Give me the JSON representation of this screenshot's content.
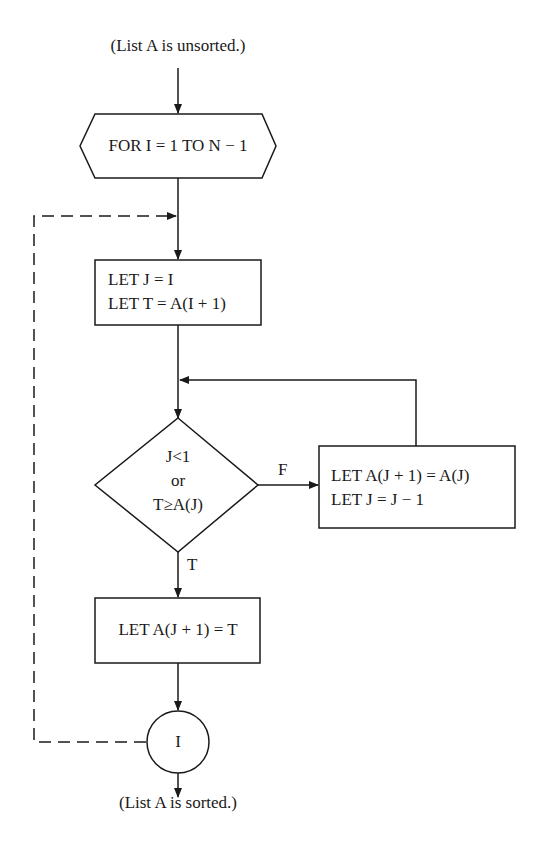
{
  "diagram": {
    "type": "flowchart",
    "start_label": "(List A is unsorted.)",
    "end_label": "(List A is sorted.)",
    "loop_header": "FOR I = 1 TO N − 1",
    "init_block": {
      "line1": "LET J = I",
      "line2": "LET T = A(I + 1)"
    },
    "decision": {
      "line1": "J<1",
      "line2": "or",
      "line3": "T≥A(J)",
      "false_label": "F",
      "true_label": "T"
    },
    "shift_block": {
      "line1": "LET A(J + 1) = A(J)",
      "line2": "LET J = J − 1"
    },
    "insert_block": {
      "line1": "LET A(J + 1) = T"
    },
    "connector": {
      "label": "I"
    },
    "colors": {
      "line": "#1a1a1a",
      "background": "#ffffff"
    }
  }
}
